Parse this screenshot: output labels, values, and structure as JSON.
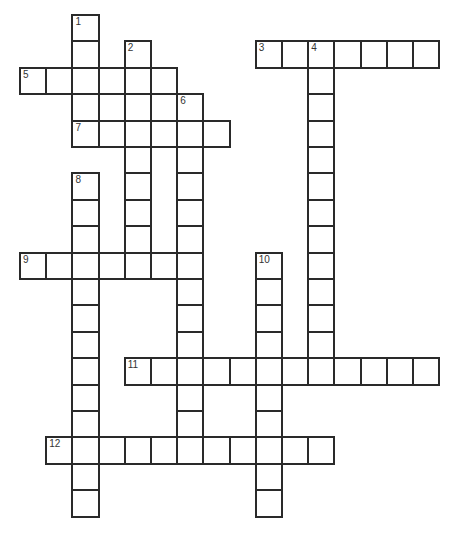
{
  "puzzle": {
    "cell_size": {
      "w": 26.2,
      "h": 26.4
    },
    "origin": {
      "x": 20,
      "y": 15
    },
    "border_color": "#2a2a2a",
    "clues_numbers": [
      {
        "number": "1",
        "row": 0,
        "col": 2,
        "direction": "down",
        "length": 5
      },
      {
        "number": "2",
        "row": 1,
        "col": 4,
        "direction": "down",
        "length": 9
      },
      {
        "number": "3",
        "row": 1,
        "col": 9,
        "direction": "across",
        "length": 7
      },
      {
        "number": "4",
        "row": 1,
        "col": 11,
        "direction": "down",
        "length": 13
      },
      {
        "number": "5",
        "row": 2,
        "col": 0,
        "direction": "across",
        "length": 6
      },
      {
        "number": "6",
        "row": 3,
        "col": 6,
        "direction": "down",
        "length": 14
      },
      {
        "number": "7",
        "row": 4,
        "col": 2,
        "direction": "across",
        "length": 6
      },
      {
        "number": "8",
        "row": 6,
        "col": 2,
        "direction": "down",
        "length": 13
      },
      {
        "number": "9",
        "row": 9,
        "col": 0,
        "direction": "across",
        "length": 7
      },
      {
        "number": "10",
        "row": 9,
        "col": 9,
        "direction": "down",
        "length": 10
      },
      {
        "number": "11",
        "row": 13,
        "col": 4,
        "direction": "across",
        "length": 12
      },
      {
        "number": "12",
        "row": 16,
        "col": 1,
        "direction": "across",
        "length": 11
      }
    ],
    "cells": [
      [
        0,
        2
      ],
      [
        1,
        2
      ],
      [
        1,
        4
      ],
      [
        1,
        9
      ],
      [
        1,
        10
      ],
      [
        1,
        11
      ],
      [
        1,
        12
      ],
      [
        1,
        13
      ],
      [
        1,
        14
      ],
      [
        1,
        15
      ],
      [
        2,
        0
      ],
      [
        2,
        1
      ],
      [
        2,
        2
      ],
      [
        2,
        3
      ],
      [
        2,
        4
      ],
      [
        2,
        5
      ],
      [
        2,
        11
      ],
      [
        3,
        2
      ],
      [
        3,
        3
      ],
      [
        3,
        4
      ],
      [
        3,
        5
      ],
      [
        3,
        6
      ],
      [
        3,
        11
      ],
      [
        4,
        2
      ],
      [
        4,
        3
      ],
      [
        4,
        4
      ],
      [
        4,
        5
      ],
      [
        4,
        6
      ],
      [
        4,
        7
      ],
      [
        4,
        11
      ],
      [
        5,
        4
      ],
      [
        5,
        6
      ],
      [
        5,
        11
      ],
      [
        6,
        2
      ],
      [
        6,
        4
      ],
      [
        6,
        6
      ],
      [
        6,
        11
      ],
      [
        7,
        2
      ],
      [
        7,
        4
      ],
      [
        7,
        6
      ],
      [
        7,
        11
      ],
      [
        8,
        2
      ],
      [
        8,
        4
      ],
      [
        8,
        6
      ],
      [
        8,
        11
      ],
      [
        9,
        0
      ],
      [
        9,
        1
      ],
      [
        9,
        2
      ],
      [
        9,
        3
      ],
      [
        9,
        4
      ],
      [
        9,
        5
      ],
      [
        9,
        6
      ],
      [
        9,
        9
      ],
      [
        9,
        11
      ],
      [
        10,
        2
      ],
      [
        10,
        6
      ],
      [
        10,
        9
      ],
      [
        10,
        11
      ],
      [
        11,
        2
      ],
      [
        11,
        6
      ],
      [
        11,
        9
      ],
      [
        11,
        11
      ],
      [
        12,
        2
      ],
      [
        12,
        6
      ],
      [
        12,
        9
      ],
      [
        12,
        11
      ],
      [
        13,
        2
      ],
      [
        13,
        4
      ],
      [
        13,
        5
      ],
      [
        13,
        6
      ],
      [
        13,
        7
      ],
      [
        13,
        8
      ],
      [
        13,
        9
      ],
      [
        13,
        10
      ],
      [
        13,
        11
      ],
      [
        13,
        12
      ],
      [
        13,
        13
      ],
      [
        13,
        14
      ],
      [
        13,
        15
      ],
      [
        14,
        2
      ],
      [
        14,
        6
      ],
      [
        14,
        9
      ],
      [
        15,
        2
      ],
      [
        15,
        6
      ],
      [
        15,
        9
      ],
      [
        16,
        1
      ],
      [
        16,
        2
      ],
      [
        16,
        3
      ],
      [
        16,
        4
      ],
      [
        16,
        5
      ],
      [
        16,
        6
      ],
      [
        16,
        7
      ],
      [
        16,
        8
      ],
      [
        16,
        9
      ],
      [
        16,
        10
      ],
      [
        16,
        11
      ],
      [
        17,
        2
      ],
      [
        17,
        9
      ],
      [
        18,
        2
      ],
      [
        18,
        9
      ]
    ]
  }
}
